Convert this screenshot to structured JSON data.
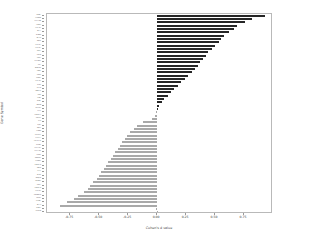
{
  "chart_data": {
    "type": "bar",
    "orientation": "horizontal",
    "title": "",
    "xlabel": "Cohen's d value",
    "ylabel": "Gene Symbol",
    "xlim": [
      -0.95,
      1.0
    ],
    "xticks": [
      -0.75,
      -0.5,
      -0.25,
      0.0,
      0.25,
      0.5,
      0.75
    ],
    "xticklabels": [
      "-0.75",
      "-0.50",
      "-0.25",
      "0.00",
      "0.25",
      "0.50",
      "0.75"
    ],
    "grid": false,
    "legend": null,
    "colors": {
      "positive": "#262626",
      "negative": "#a9a9a9",
      "frame": "#b9b9b9",
      "text": "#3b3b3b"
    },
    "categories": [
      "MKI67",
      "SLC6A8",
      "SLC17A6",
      "TUBB3",
      "SLC2A1",
      "NEFL",
      "ALDOA",
      "NEFM",
      "AQP4",
      "SLC1A2",
      "SLC3A2",
      "PKM2",
      "SDHA",
      "PGK1",
      "SLC16A1",
      "CA2",
      "NDUFA4",
      "ENO2",
      "CD44",
      "PLOD2",
      "SLC2A3",
      "GFAP",
      "HIF1A",
      "SNAP25",
      "MBP",
      "SYN1",
      "APOE",
      "NRGN",
      "ATP1A3",
      "PLP1",
      "SPARCL1",
      "CALM1",
      "CLU",
      "GJA1",
      "AQP1",
      "S100B",
      "CX3CR1",
      "P2RY12",
      "TMEM119",
      "GRIN1",
      "SLC17A7",
      "SLC12A5",
      "GAD1",
      "GABRA1",
      "SLC6A1",
      "CAMK2A",
      "SNCA",
      "SYT1",
      "DLG4",
      "KCNJ10",
      "RBFOX3",
      "MAP2",
      "CAMK2B",
      "SLC1A3",
      "CACNA1A",
      "GRIA1",
      "STMN2",
      "NEFH",
      "VSNL1",
      "MTURN"
    ],
    "values": [
      0.93,
      0.82,
      0.76,
      0.69,
      0.66,
      0.62,
      0.58,
      0.55,
      0.53,
      0.5,
      0.47,
      0.44,
      0.42,
      0.4,
      0.37,
      0.35,
      0.33,
      0.3,
      0.27,
      0.24,
      0.21,
      0.18,
      0.15,
      0.12,
      0.09,
      0.06,
      0.04,
      0.02,
      0.01,
      -0.01,
      -0.02,
      -0.04,
      -0.12,
      -0.17,
      -0.2,
      -0.23,
      -0.26,
      -0.28,
      -0.3,
      -0.32,
      -0.34,
      -0.36,
      -0.38,
      -0.4,
      -0.42,
      -0.44,
      -0.46,
      -0.48,
      -0.5,
      -0.52,
      -0.55,
      -0.58,
      -0.6,
      -0.63,
      -0.68,
      -0.72,
      -0.78,
      -0.84,
      -0.01,
      -0.005
    ]
  }
}
